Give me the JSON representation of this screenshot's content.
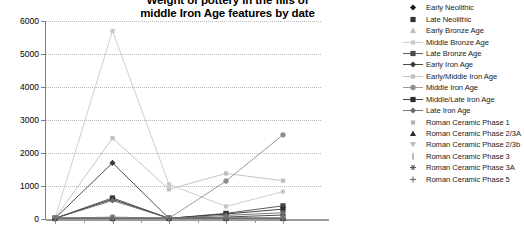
{
  "title": {
    "line1": "Weight of pottery in the fills of",
    "line2": "middle Iron Age features by date"
  },
  "axes": {
    "y_ticks": [
      "0",
      "1000",
      "2000",
      "3000",
      "4000",
      "5000",
      "6000"
    ],
    "ylabel": "",
    "xlabel": ""
  },
  "legend": {
    "items": [
      {
        "label": "Early Neolithic",
        "marker": "diamond-filled-marker",
        "color": "#1a1a1a",
        "line": false
      },
      {
        "label": "Late Neolithic",
        "marker": "square-filled-marker",
        "color": "#303030",
        "line": false
      },
      {
        "label": "Early Bronze Age",
        "marker": "triangle-up-marker",
        "color": "#bdbdbd",
        "line": false
      },
      {
        "label": "Middle Bronze Age",
        "marker": "square-small-marker",
        "color": "#c8c8c8",
        "line": true
      },
      {
        "label": "Late Bronze Age",
        "marker": "square-filled-marker",
        "color": "#4a4a4a",
        "line": true
      },
      {
        "label": "Early Iron Age",
        "marker": "diamond-filled-marker",
        "color": "#3a3a3a",
        "line": true
      },
      {
        "label": "Early/Middle Iron Age",
        "marker": "square-small-marker",
        "color": "#c0c0c0",
        "line": true
      },
      {
        "label": "Middle Iron Age",
        "marker": "circle-filled-marker",
        "color": "#8f8f8f",
        "line": true
      },
      {
        "label": "Middle/Late Iron Age",
        "marker": "square-filled-marker",
        "color": "#2e2e2e",
        "line": true
      },
      {
        "label": "Late Iron Age",
        "marker": "diamond-filled-marker",
        "color": "#6a6a6a",
        "line": true
      },
      {
        "label": "Roman Ceramic Phase 1",
        "marker": "square-small-marker",
        "color": "#b5b5b5",
        "line": false
      },
      {
        "label": "Roman Ceramic Phase 2/3A",
        "marker": "triangle-up-filled-marker",
        "color": "#2b2b2b",
        "line": false
      },
      {
        "label": "Roman Ceramic Phase 2/3b",
        "marker": "triangle-down-marker",
        "color": "#bcbcbc",
        "line": false
      },
      {
        "label": "Roman Ceramic Phase 3",
        "marker": "bar-vertical-marker",
        "color": "#9e9e9e",
        "line": false
      },
      {
        "label": "Roman Ceramic Phase 3A",
        "marker": "asterisk-marker",
        "color": "#585858",
        "line": false
      },
      {
        "label": "Roman Ceramic Phase 5",
        "marker": "plus-marker",
        "color": "#6d6d6d",
        "line": false
      }
    ]
  },
  "chart_data": {
    "type": "line",
    "title": "Weight of pottery in the fills of middle Iron Age features by date",
    "xlabel": "",
    "ylabel": "",
    "ylim": [
      0,
      6000
    ],
    "ytick_step": 1000,
    "grid": true,
    "legend_position": "right",
    "x_tick_count": 5,
    "categories": [
      "1",
      "2",
      "3",
      "4",
      "5"
    ],
    "series": [
      {
        "name": "Middle Bronze Age",
        "color": "#c8c8c8",
        "marker": "square-small-marker",
        "values": [
          30,
          5700,
          1050,
          380,
          830
        ]
      },
      {
        "name": "Early/Middle Iron Age",
        "color": "#c0c0c0",
        "marker": "square-small-marker",
        "values": [
          20,
          2450,
          900,
          1380,
          1160
        ]
      },
      {
        "name": "Middle Iron Age",
        "color": "#8f8f8f",
        "marker": "circle-filled-marker",
        "values": [
          20,
          60,
          20,
          1150,
          2550
        ]
      },
      {
        "name": "Early Iron Age",
        "color": "#3a3a3a",
        "marker": "diamond-filled-marker",
        "values": [
          20,
          1700,
          20,
          60,
          120
        ]
      },
      {
        "name": "Late Bronze Age",
        "color": "#4a4a4a",
        "marker": "square-filled-marker",
        "values": [
          20,
          640,
          20,
          170,
          400
        ]
      },
      {
        "name": "Middle/Late Iron Age",
        "color": "#2e2e2e",
        "marker": "square-filled-marker",
        "values": [
          20,
          600,
          20,
          150,
          300
        ]
      },
      {
        "name": "Late Iron Age",
        "color": "#6a6a6a",
        "marker": "diamond-filled-marker",
        "values": [
          20,
          560,
          20,
          110,
          190
        ]
      },
      {
        "name": "Early Neolithic",
        "color": "#1a1a1a",
        "marker": "diamond-filled-marker",
        "values": [
          20,
          20,
          20,
          20,
          20
        ]
      },
      {
        "name": "Late Neolithic",
        "color": "#303030",
        "marker": "square-filled-marker",
        "values": [
          20,
          20,
          20,
          20,
          20
        ]
      },
      {
        "name": "Early Bronze Age",
        "color": "#bdbdbd",
        "marker": "triangle-up-marker",
        "values": [
          20,
          20,
          20,
          20,
          20
        ]
      },
      {
        "name": "Roman Ceramic Phase 1",
        "color": "#b5b5b5",
        "marker": "square-small-marker",
        "values": [
          20,
          20,
          20,
          20,
          20
        ]
      },
      {
        "name": "Roman Ceramic Phase 2/3A",
        "color": "#2b2b2b",
        "marker": "triangle-up-filled-marker",
        "values": [
          20,
          20,
          20,
          20,
          20
        ]
      },
      {
        "name": "Roman Ceramic Phase 2/3b",
        "color": "#bcbcbc",
        "marker": "triangle-down-marker",
        "values": [
          20,
          20,
          20,
          20,
          20
        ]
      },
      {
        "name": "Roman Ceramic Phase 3",
        "color": "#9e9e9e",
        "marker": "bar-vertical-marker",
        "values": [
          20,
          20,
          20,
          20,
          20
        ]
      },
      {
        "name": "Roman Ceramic Phase 3A",
        "color": "#585858",
        "marker": "asterisk-marker",
        "values": [
          20,
          20,
          20,
          20,
          20
        ]
      },
      {
        "name": "Roman Ceramic Phase 5",
        "color": "#6d6d6d",
        "marker": "plus-marker",
        "values": [
          20,
          20,
          20,
          20,
          20
        ]
      }
    ]
  }
}
